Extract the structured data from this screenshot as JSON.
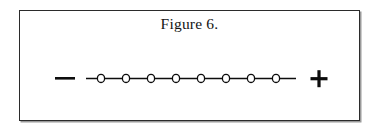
{
  "figure": {
    "title": "Figure 6.",
    "caption_number": "6",
    "border_color": "#2b2b2b",
    "shadow_color": "#9a9a9a",
    "background_color": "#ffffff",
    "ink_color": "#0d0d0d"
  },
  "chart_data": {
    "type": "line",
    "title": "Figure 6.",
    "xlabel": "",
    "ylabel": "",
    "axis": {
      "left_pole_label": "—",
      "left_pole_name": "minus",
      "right_pole_label": "+",
      "right_pole_name": "plus",
      "line_start_x": 85,
      "line_end_x": 295,
      "line_y": 78
    },
    "marker": {
      "shape": "open-circle",
      "count": 8,
      "radius_x": 3.6,
      "radius_y": 4.1,
      "fill": "#ffffff",
      "stroke": "#0d0d0d"
    },
    "categories": [
      "1",
      "2",
      "3",
      "4",
      "5",
      "6",
      "7",
      "8"
    ],
    "x": [
      100,
      125,
      150,
      175,
      200,
      225,
      250,
      275
    ],
    "values": [
      0,
      0,
      0,
      0,
      0,
      0,
      0,
      0
    ],
    "grid": false,
    "legend": null
  },
  "symbols": {
    "minus_sign": "—",
    "minus_x": 62,
    "minus_y": 78,
    "plus_sign": "+",
    "plus_x": 318,
    "plus_y": 78
  }
}
